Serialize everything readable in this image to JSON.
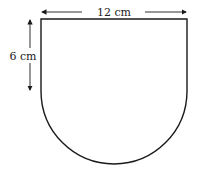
{
  "diagram": {
    "shape": "rectangle with semicircle base",
    "width_label": "12 cm",
    "height_label": "6 cm",
    "stroke_color": "#1a1a1a",
    "background": "#ffffff"
  }
}
